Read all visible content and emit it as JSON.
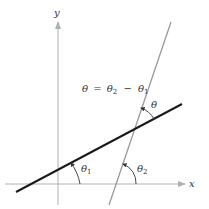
{
  "diagram": {
    "axes": {
      "x_label": "x",
      "y_label": "y",
      "axis_color": "#b0b0b0"
    },
    "lines": [
      {
        "name": "line-1",
        "color": "#1a1a1a",
        "weight": "thick",
        "angle_label": "θ",
        "angle_sub": "1"
      },
      {
        "name": "line-2",
        "color": "#9a9a9a",
        "weight": "thin",
        "angle_label": "θ",
        "angle_sub": "2"
      }
    ],
    "between_angle_label": "θ",
    "equation": {
      "lhs": "θ",
      "eq": "=",
      "t2": "θ",
      "t2_sub": "2",
      "minus": "−",
      "t1": "θ",
      "t1_sub": "1"
    }
  }
}
